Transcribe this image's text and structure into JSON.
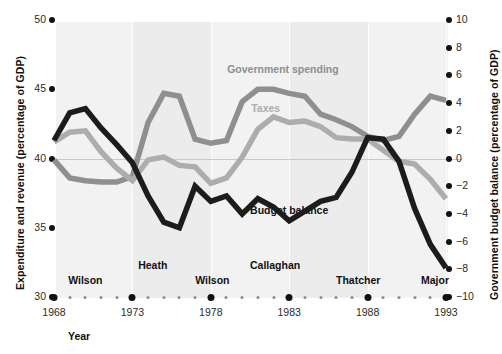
{
  "chart_data": {
    "type": "line",
    "title": "",
    "xlabel": "Year",
    "ylabel": "Expenditure and revenue (percentage of GDP)",
    "y2label": "Government budget balance (percentage of GDP)",
    "xlim": [
      1968,
      1993
    ],
    "ylim": [
      30,
      50
    ],
    "y2lim": [
      -10,
      10
    ],
    "grid": true,
    "legend_position": "inline-annotations",
    "x": [
      1968,
      1969,
      1970,
      1971,
      1972,
      1973,
      1974,
      1975,
      1976,
      1977,
      1978,
      1979,
      1980,
      1981,
      1982,
      1983,
      1984,
      1985,
      1986,
      1987,
      1988,
      1989,
      1990,
      1991,
      1992,
      1993
    ],
    "xticks_major": [
      1968,
      1973,
      1978,
      1983,
      1988,
      1993
    ],
    "xtick_labels": [
      "1968",
      "1973",
      "1978",
      "1983",
      "1988",
      "1993"
    ],
    "yticks": [
      30,
      35,
      40,
      45,
      50
    ],
    "ytick_labels": [
      "30",
      "35",
      "40",
      "45",
      "50"
    ],
    "y2ticks": [
      -10,
      -8,
      -6,
      -4,
      -2,
      0,
      2,
      4,
      6,
      8,
      10
    ],
    "y2tick_labels": [
      "−10",
      "−8",
      "−6",
      "−4",
      "−2",
      "0",
      "2",
      "4",
      "6",
      "8",
      "10"
    ],
    "series": [
      {
        "name": "Government spending",
        "axis": "left",
        "color": "#8f8f8f",
        "label_x": 1982.6,
        "label_y": 46.4,
        "values": [
          39.9,
          38.6,
          38.4,
          38.3,
          38.3,
          38.7,
          42.6,
          44.7,
          44.5,
          41.4,
          41.1,
          41.3,
          44.1,
          45.0,
          45.0,
          44.7,
          44.5,
          43.2,
          42.8,
          42.3,
          41.6,
          41.3,
          41.6,
          43.2,
          44.5,
          44.2
        ]
      },
      {
        "name": "Taxes",
        "axis": "left",
        "color": "#adadad",
        "label_x": 1981.5,
        "label_y": 43.6,
        "values": [
          41.2,
          41.9,
          42.0,
          40.5,
          39.3,
          38.4,
          39.9,
          40.1,
          39.5,
          39.4,
          38.2,
          38.6,
          40.1,
          42.1,
          43.0,
          42.6,
          42.7,
          42.3,
          41.5,
          41.4,
          41.4,
          40.6,
          39.8,
          39.6,
          38.5,
          37.1
        ]
      },
      {
        "name": "Budget balance",
        "axis": "right",
        "color": "#1c1c1c",
        "label_x": 1983.0,
        "label_y": -3.8,
        "values": [
          1.3,
          3.3,
          3.6,
          2.2,
          1.0,
          -0.3,
          -2.7,
          -4.6,
          -5.0,
          -2.0,
          -3.1,
          -2.7,
          -4.0,
          -2.9,
          -3.5,
          -4.5,
          -3.8,
          -3.1,
          -2.8,
          -1.0,
          1.5,
          1.4,
          -0.2,
          -3.6,
          -6.2,
          -7.9
        ]
      }
    ],
    "annotations": [
      {
        "text": "Wilson",
        "x": 1970.0
      },
      {
        "text": "Heath",
        "x": 1974.3
      },
      {
        "text": "Wilson",
        "x": 1978.1
      },
      {
        "text": "Callaghan",
        "x": 1982.1
      },
      {
        "text": "Thatcher",
        "x": 1987.4
      },
      {
        "text": "Major",
        "x": 1992.3
      }
    ],
    "year_caption": "Year"
  },
  "colors": {
    "spending": "#8f8f8f",
    "taxes": "#adadad",
    "balance": "#1c1c1c",
    "plot_bg": "#f2f2f2",
    "zero_line": "#c9c9c9"
  }
}
